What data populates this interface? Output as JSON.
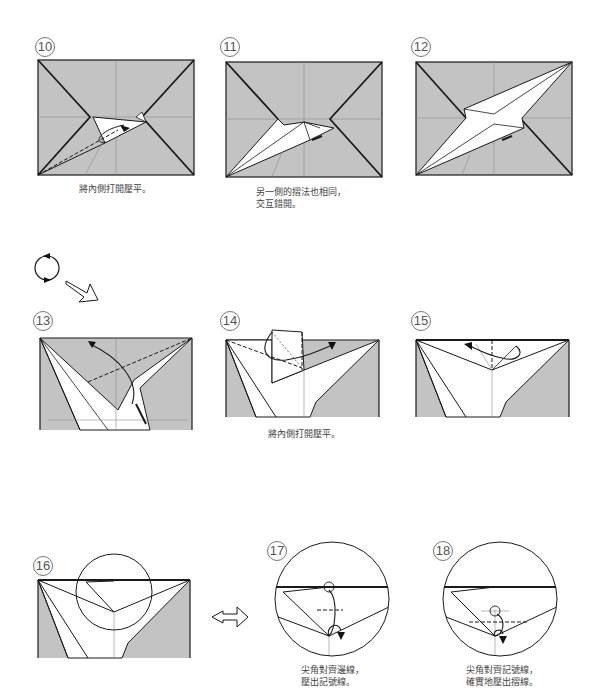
{
  "page": {
    "number_mark": ""
  },
  "colors": {
    "paper_gray": "#c3c3c3",
    "line": "#1a1a1a",
    "crease": "#8a8a8a",
    "text": "#444444"
  },
  "steps": [
    {
      "id": "10",
      "label": "⑩",
      "caption": [
        "將內側打開壓平。"
      ]
    },
    {
      "id": "11",
      "label": "⑪",
      "caption": [
        "另一側的摺法也相同，",
        "交互錯開。"
      ]
    },
    {
      "id": "12",
      "label": "⑫",
      "caption": []
    },
    {
      "id": "13",
      "label": "⑬",
      "caption": []
    },
    {
      "id": "14",
      "label": "⑭",
      "caption": [
        "將內側打開壓平。"
      ]
    },
    {
      "id": "15",
      "label": "⑮",
      "caption": []
    },
    {
      "id": "16",
      "label": "⑯",
      "caption": []
    },
    {
      "id": "17",
      "label": "⑰",
      "caption": [
        "尖角對齊邊線，",
        "壓出記號線。"
      ]
    },
    {
      "id": "18",
      "label": "⑱",
      "caption": [
        "尖角對齊記號線，",
        "確實地壓出摺線。"
      ]
    }
  ],
  "symbols": {
    "rotate": "rotate-icon",
    "next": "hollow-arrow-icon",
    "zoom_in": "hollow-arrow-icon"
  }
}
